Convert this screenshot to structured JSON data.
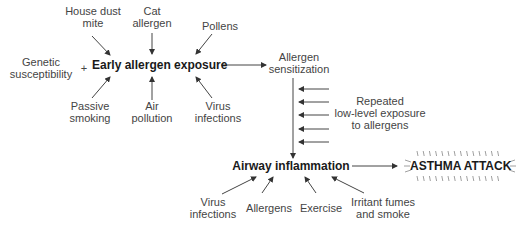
{
  "diagram": {
    "nodes": {
      "house_dust_mite": "House dust\nmite",
      "cat_allergen": "Cat\nallergen",
      "pollens": "Pollens",
      "genetic_susceptibility": "Genetic\nsusceptibility",
      "plus_sign": "+",
      "early_allergen_exposure": "Early allergen exposure",
      "passive_smoking": "Passive\nsmoking",
      "air_pollution": "Air\npollution",
      "virus_infections_top": "Virus\ninfections",
      "allergen_sensitization": "Allergen\nsensitization",
      "repeated_exposure": "Repeated\nlow-level exposure\nto allergens",
      "airway_inflammation": "Airway inflammation",
      "asthma_attack": "ASTHMA ATTACK",
      "virus_infections_bottom": "Virus\ninfections",
      "allergens": "Allergens",
      "exercise": "Exercise",
      "irritant_fumes": "Irritant fumes\nand smoke"
    },
    "edges": [
      {
        "from": "house_dust_mite",
        "to": "early_allergen_exposure"
      },
      {
        "from": "cat_allergen",
        "to": "early_allergen_exposure"
      },
      {
        "from": "pollens",
        "to": "early_allergen_exposure"
      },
      {
        "from": "passive_smoking",
        "to": "early_allergen_exposure"
      },
      {
        "from": "air_pollution",
        "to": "early_allergen_exposure"
      },
      {
        "from": "virus_infections_top",
        "to": "early_allergen_exposure"
      },
      {
        "from": "early_allergen_exposure",
        "to": "allergen_sensitization"
      },
      {
        "from": "allergen_sensitization",
        "to": "airway_inflammation"
      },
      {
        "from": "repeated_exposure",
        "to": "allergen_sensitization"
      },
      {
        "from": "virus_infections_bottom",
        "to": "airway_inflammation"
      },
      {
        "from": "allergens",
        "to": "airway_inflammation"
      },
      {
        "from": "exercise",
        "to": "airway_inflammation"
      },
      {
        "from": "irritant_fumes",
        "to": "airway_inflammation"
      },
      {
        "from": "airway_inflammation",
        "to": "asthma_attack"
      }
    ]
  }
}
